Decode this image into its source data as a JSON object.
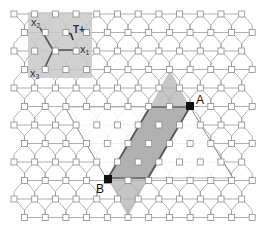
{
  "figure": {
    "width": 268,
    "height": 230,
    "background": "#ffffff",
    "lattice": {
      "row_start_y": 14,
      "row_spacing": 18.5,
      "rows": 12,
      "col_spacing": 20.7,
      "even_row_start_x": 14,
      "odd_row_start_x": 24.5,
      "node_size": 6,
      "line_color": "#9a9a9a",
      "node_fill": "#ffffff",
      "node_stroke": "#8a8a8a"
    },
    "inset": {
      "box": {
        "x": 28,
        "y": 12,
        "w": 64,
        "h": 66
      },
      "fill": "#c9c9c9",
      "opacity": 0.85,
      "origin": {
        "x": 53,
        "y": 50
      },
      "axes": [
        {
          "name": "x1",
          "to": {
            "x": 78,
            "y": 50
          }
        },
        {
          "name": "x2",
          "to": {
            "x": 40,
            "y": 28
          }
        },
        {
          "name": "x3",
          "to": {
            "x": 43,
            "y": 72
          }
        }
      ],
      "axis_color": "#555555",
      "labels": {
        "x1": {
          "base": "x",
          "sub": "1"
        },
        "x2": {
          "base": "x",
          "sub": "2"
        },
        "x3": {
          "base": "x",
          "sub": "3"
        },
        "tplus": "T+"
      }
    },
    "white_region": {
      "points": [
        [
          65,
          107
        ],
        [
          190,
          107
        ],
        [
          233,
          178
        ],
        [
          106,
          178
        ]
      ],
      "fill": "#ffffff",
      "opacity": 0.82,
      "edge_color": "#8c8c8c"
    },
    "gray_band": {
      "points": [
        [
          170,
          70
        ],
        [
          190,
          107
        ],
        [
          148,
          178
        ],
        [
          128,
          217
        ],
        [
          108,
          178
        ],
        [
          150,
          107
        ]
      ],
      "fill": "#b3b3b3",
      "opacity": 0.75
    },
    "parallelogram": {
      "points": [
        [
          150,
          107
        ],
        [
          190,
          107
        ],
        [
          148,
          178
        ],
        [
          108,
          178
        ]
      ],
      "fill": "#a0a0a0",
      "opacity": 0.55,
      "stroke": "#555555"
    },
    "points": {
      "A": {
        "label": "A",
        "x": 190,
        "y": 106
      },
      "B": {
        "label": "B",
        "x": 108,
        "y": 179
      }
    }
  }
}
